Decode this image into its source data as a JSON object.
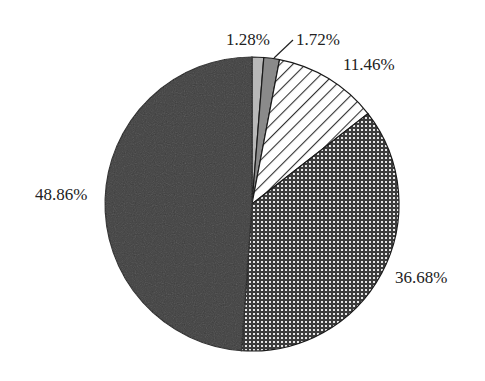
{
  "chart_data": {
    "type": "pie",
    "title": "",
    "categories": [
      "Slice A (light gray)",
      "Slice B (medium gray)",
      "Slice C (diagonal hatch)",
      "Slice D (cross-hatch)",
      "Slice E (dark)"
    ],
    "values": [
      1.28,
      1.72,
      11.46,
      36.68,
      48.86
    ],
    "labels": [
      "1.28%",
      "1.72%",
      "11.46%",
      "36.68%",
      "48.86%"
    ],
    "start_angle_deg": 0,
    "direction": "clockwise",
    "legend": "none",
    "fills": [
      "#b8b8b8",
      "#8a8a8a",
      "hatch-diagonal",
      "hatch-cross",
      "#3a3a3a"
    ]
  },
  "labels": {
    "l1": "1.28%",
    "l2": "1.72%",
    "l3": "11.46%",
    "l4": "36.68%",
    "l5": "48.86%"
  }
}
